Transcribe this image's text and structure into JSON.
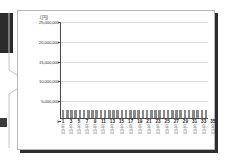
{
  "chart_data": {
    "type": "bar",
    "title": "",
    "subtitle": "",
    "xlabel": "",
    "ylabel": "",
    "yunit": "(円)",
    "ylim": [
      0,
      25000000
    ],
    "ytick_values": [
      0,
      5000000,
      10000000,
      15000000,
      20000000,
      25000000
    ],
    "ytick_labels": [
      "0",
      "5,000,000",
      "10,000,000",
      "15,000,000",
      "20,000,000",
      "25,000,000"
    ],
    "grid": true,
    "legend": "none",
    "xtick_labels": [
      "1",
      "",
      "3",
      "",
      "5",
      "",
      "7",
      "",
      "9",
      "",
      "11",
      "",
      "13",
      "",
      "15",
      "",
      "17",
      "",
      "19",
      "",
      "21",
      "",
      "23",
      "",
      "25",
      "",
      "27",
      "",
      "29",
      "",
      "31",
      "",
      "33",
      "",
      "35"
    ],
    "xtick_suffix_line1": "年",
    "xtick_suffix_line2": "目",
    "categories": [
      "1年目",
      "2年目",
      "3年目",
      "4年目",
      "5年目",
      "6年目",
      "7年目",
      "8年目",
      "9年目",
      "10年目",
      "11年目",
      "12年目",
      "13年目",
      "14年目",
      "15年目",
      "16年目",
      "17年目",
      "18年目",
      "19年目",
      "20年目",
      "21年目",
      "22年目",
      "23年目",
      "24年目",
      "25年目",
      "26年目",
      "27年目",
      "28年目",
      "29年目",
      "30年目",
      "31年目",
      "32年目",
      "33年目",
      "34年目",
      "35年目"
    ],
    "values": [
      2000000,
      2000000,
      2000000,
      2000000,
      2000000,
      2000000,
      2000000,
      2000000,
      2000000,
      2000000,
      2000000,
      2000000,
      2000000,
      2000000,
      2000000,
      2000000,
      2000000,
      2000000,
      2000000,
      2000000,
      2000000,
      2000000,
      2000000,
      2000000,
      2000000,
      2000000,
      2000000,
      2000000,
      2000000,
      2000000,
      2000000,
      2000000,
      2000000,
      2000000,
      2000000
    ],
    "bar_color": "#8a8a8a",
    "grid_color": "#dcdcdc",
    "axis_color": "#4a4a4a"
  }
}
